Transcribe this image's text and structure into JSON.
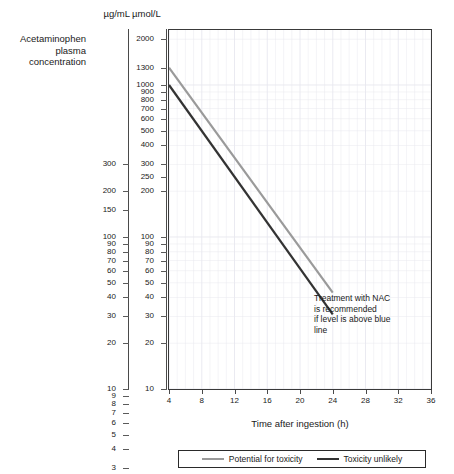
{
  "chart_title": "Acetaminophen\nplasma\nconcentration",
  "units": {
    "left_axis_header": "µg/mL",
    "right_axis_header": "µmol/L"
  },
  "annotation": "Treatment with NAC is recommended if level is above blue line",
  "annotation_lines": [
    "Treatment with NAC",
    "is recommended",
    "if level is above blue",
    "line"
  ],
  "colors": {
    "potential_for_toxicity": "#9a9a9a",
    "toxicity_unlikely": "#333333",
    "grid": "#e8e8ef",
    "frame": "#3a3a3a",
    "text": "#1a1a1a"
  },
  "legend": {
    "position": "bottom-outside",
    "entries": [
      {
        "label": "Potential for toxicity",
        "color": "#9a9a9a"
      },
      {
        "label": "Toxicity unlikely",
        "color": "#333333"
      }
    ]
  },
  "chart_data": {
    "type": "line",
    "subtitle": "",
    "xlabel": "Time after ingestion (h)",
    "ylabel": "µmol/L",
    "ylabel_secondary": "µg/mL",
    "xlim": [
      4,
      36
    ],
    "ylim": [
      10,
      2300
    ],
    "yscale": "log",
    "xscale": "linear",
    "grid": true,
    "xticks": [
      4,
      8,
      12,
      16,
      20,
      24,
      28,
      32,
      36
    ],
    "xtick_labels": [
      "4",
      "8",
      "12",
      "16",
      "20",
      "24",
      "28",
      "32",
      "36"
    ],
    "yticks_umol": [
      2000,
      1300,
      1000,
      900,
      800,
      700,
      600,
      500,
      400,
      300,
      250,
      200,
      100,
      90,
      80,
      70,
      60,
      50,
      40,
      30,
      20,
      10
    ],
    "ytick_labels_umol": [
      "2000",
      "1300",
      "1000",
      "900",
      "800",
      "700",
      "600",
      "500",
      "400",
      "300",
      "250",
      "200",
      "100",
      "90",
      "80",
      "70",
      "60",
      "50",
      "40",
      "30",
      "20",
      "10"
    ],
    "yticks_ug": [
      300,
      200,
      150,
      100,
      90,
      80,
      70,
      60,
      50,
      40,
      30,
      20,
      10,
      9,
      8,
      7,
      6,
      5,
      4,
      3,
      2
    ],
    "ytick_labels_ug": [
      "300",
      "200",
      "150",
      "100",
      "90",
      "80",
      "70",
      "60",
      "50",
      "40",
      "30",
      "20",
      "10",
      "9",
      "8",
      "7",
      "6",
      "5",
      "4",
      "3",
      "2"
    ],
    "series": [
      {
        "name": "Potential for toxicity",
        "color": "#9a9a9a",
        "units": "µmol/L",
        "x": [
          4,
          24
        ],
        "y": [
          1300,
          43
        ],
        "x_units": "h"
      },
      {
        "name": "Toxicity unlikely",
        "color": "#333333",
        "units": "µmol/L",
        "x": [
          4,
          24
        ],
        "y": [
          1000,
          31
        ],
        "x_units": "h"
      }
    ],
    "annotations": [
      {
        "text": "Treatment with NAC is recommended if level is above blue line",
        "x": 25.5,
        "y": 55
      }
    ]
  },
  "axis_ug_ticks": [
    {
      "label": "300",
      "value": 300
    },
    {
      "label": "200",
      "value": 200
    },
    {
      "label": "150",
      "value": 150
    },
    {
      "label": "100",
      "value": 100
    },
    {
      "label": "90",
      "value": 90
    },
    {
      "label": "80",
      "value": 80
    },
    {
      "label": "70",
      "value": 70
    },
    {
      "label": "60",
      "value": 60
    },
    {
      "label": "50",
      "value": 50
    },
    {
      "label": "40",
      "value": 40
    },
    {
      "label": "30",
      "value": 30
    },
    {
      "label": "20",
      "value": 20
    },
    {
      "label": "10",
      "value": 10
    },
    {
      "label": "9",
      "value": 9
    },
    {
      "label": "8",
      "value": 8
    },
    {
      "label": "7",
      "value": 7
    },
    {
      "label": "6",
      "value": 6
    },
    {
      "label": "5",
      "value": 5
    },
    {
      "label": "4",
      "value": 4
    },
    {
      "label": "3",
      "value": 3
    },
    {
      "label": "2",
      "value": 2
    }
  ],
  "axis_umol_ticks": [
    {
      "label": "2000",
      "value": 2000
    },
    {
      "label": "1300",
      "value": 1300
    },
    {
      "label": "1000",
      "value": 1000
    },
    {
      "label": "900",
      "value": 900
    },
    {
      "label": "800",
      "value": 800
    },
    {
      "label": "700",
      "value": 700
    },
    {
      "label": "600",
      "value": 600
    },
    {
      "label": "500",
      "value": 500
    },
    {
      "label": "400",
      "value": 400
    },
    {
      "label": "300",
      "value": 300
    },
    {
      "label": "250",
      "value": 250
    },
    {
      "label": "200",
      "value": 200
    },
    {
      "label": "100",
      "value": 100
    },
    {
      "label": "90",
      "value": 90
    },
    {
      "label": "80",
      "value": 80
    },
    {
      "label": "70",
      "value": 70
    },
    {
      "label": "60",
      "value": 60
    },
    {
      "label": "50",
      "value": 50
    },
    {
      "label": "40",
      "value": 40
    },
    {
      "label": "30",
      "value": 30
    },
    {
      "label": "20",
      "value": 20
    },
    {
      "label": "10",
      "value": 10
    }
  ]
}
